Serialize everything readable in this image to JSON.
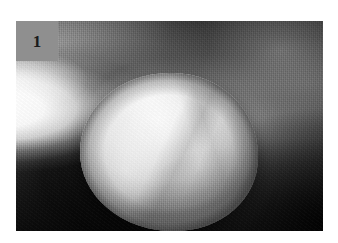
{
  "figure": {
    "panel_label": "1",
    "caption_alt": "Round ball of pale dough resting on a dark surface, grayscale scanned photograph",
    "colors": {
      "panel_label_background": "#8f8f8f",
      "panel_label_text": "#1b1b1b",
      "page_background": "#ffffff",
      "photo_dark_background": "#151515",
      "photo_highlight": "#ffffff",
      "dough_light": "#fbfbfb",
      "dough_midtone": "#d3d3d3",
      "dough_shadow": "#7a7a7a"
    },
    "geometry": {
      "photo_left": 16,
      "photo_top": 21,
      "photo_width": 307,
      "photo_height": 210,
      "label_width": 42,
      "label_height": 40
    }
  }
}
